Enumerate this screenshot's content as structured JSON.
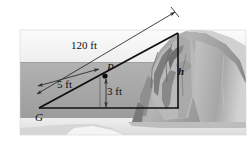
{
  "figure": {
    "name": "cliff-height-triangle-figure",
    "width": 252,
    "height": 149,
    "background_color": "#ffffff"
  },
  "labels": {
    "hypotenuse_length": "120 ft",
    "partial_length": "5 ft",
    "vertical_offset": "3 ft",
    "cliff_height_symbol": "h",
    "point_p": "P",
    "point_g": "G"
  },
  "geometry": {
    "ground_point_g": {
      "x": 39,
      "y": 108
    },
    "point_p": {
      "x": 105,
      "y": 75
    },
    "cliff_top": {
      "x": 178,
      "y": 33
    },
    "cliff_base": {
      "x": 178,
      "y": 108
    },
    "dim_120_start": {
      "x": 36,
      "y": 93
    },
    "dim_120_end": {
      "x": 176,
      "y": 11
    },
    "dim_5_start": {
      "x": 37,
      "y": 85
    },
    "dim_5_end": {
      "x": 98,
      "y": 68
    },
    "dim_3_top": {
      "x": 106,
      "y": 77
    },
    "dim_3_bottom": {
      "x": 106,
      "y": 108
    }
  },
  "colors": {
    "line": "#101010",
    "dimension_line": "#3a3a3a",
    "ground": "#a9a9a9",
    "sky_band": "#f2f2f2",
    "rock_light": "#c9c9c9",
    "rock_mid": "#a0a0a0",
    "rock_dark": "#6e6e6e",
    "water": "#e8e8e8",
    "photo_border": "#cfcfcf"
  },
  "photo": {
    "left": 20,
    "top": 30,
    "width": 226,
    "height": 105
  }
}
